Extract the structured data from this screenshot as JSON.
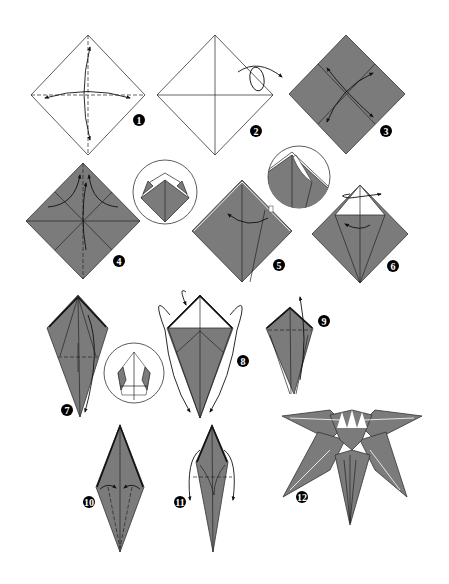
{
  "diagram": {
    "paper_color": "#7b7b7b",
    "steps": [
      {
        "number": "1",
        "label": "1",
        "description": "Crease along both diagonals (white side up)"
      },
      {
        "number": "2",
        "label": "2",
        "description": "Turn the paper over"
      },
      {
        "number": "3",
        "label": "3",
        "description": "Crease along both book-fold lines (colored side)"
      },
      {
        "number": "4",
        "label": "4",
        "description": "Collapse into a square base; inset shows the collapsing"
      },
      {
        "number": "5",
        "label": "5",
        "description": "Kite-fold the flap; inset shows squash detail"
      },
      {
        "number": "6",
        "label": "6",
        "description": "Petal fold; turn over and repeat"
      },
      {
        "number": "7",
        "label": "7",
        "description": "Fold edges to center; inset shows detail"
      },
      {
        "number": "8",
        "label": "8",
        "description": "Fold the flaps down on both sides"
      },
      {
        "number": "9",
        "label": "9",
        "description": "Fold the flap up"
      },
      {
        "number": "10",
        "label": "10",
        "description": "Fold edges to center line"
      },
      {
        "number": "11",
        "label": "11",
        "description": "Fold petals down, curl outward"
      },
      {
        "number": "12",
        "label": "12",
        "description": "Finished lily / flower model"
      }
    ]
  }
}
